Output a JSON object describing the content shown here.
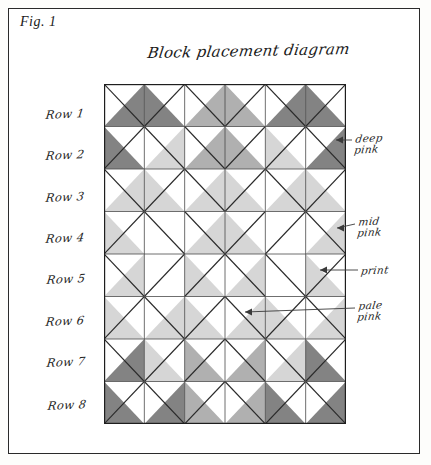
{
  "figure": {
    "label": "Fig. 1",
    "title": "Block placement diagram"
  },
  "rows": [
    {
      "label": "Row 1"
    },
    {
      "label": "Row 2"
    },
    {
      "label": "Row 3"
    },
    {
      "label": "Row 4"
    },
    {
      "label": "Row 5"
    },
    {
      "label": "Row 6"
    },
    {
      "label": "Row 7"
    },
    {
      "label": "Row 8"
    }
  ],
  "callouts": [
    {
      "id": "deep-pink",
      "label": "deep\npink"
    },
    {
      "id": "mid-pink",
      "label": "mid\npink"
    },
    {
      "id": "print",
      "label": "print"
    },
    {
      "id": "pale-pink",
      "label": "pale\npink"
    }
  ],
  "palette": {
    "deep_pink": "#838383",
    "mid_pink": "#b0b0b0",
    "pale_pink": "#d6d6d6",
    "print": "#ffffff",
    "ink": "#2a2a2a",
    "paper": "#ffffff"
  },
  "chart_data": {
    "type": "diagram",
    "title": "Block placement diagram",
    "grid": {
      "rows": 8,
      "cols": 6,
      "cell_px": 40.3
    },
    "fabrics": [
      "print",
      "pale pink",
      "mid pink",
      "deep pink"
    ],
    "note": "Each grid cell is a half-square-triangle block split along one diagonal; the two triangles are listed as [upper-left triangle, lower-right triangle] for diagonal '\\' cells and [upper-right, lower-left] for diagonal '/' cells.",
    "cells": [
      [
        {
          "d": "\\",
          "a": "print",
          "b": "deep"
        },
        {
          "d": "/",
          "a": "print",
          "b": "deep"
        },
        {
          "d": "\\",
          "a": "print",
          "b": "mid"
        },
        {
          "d": "/",
          "a": "print",
          "b": "mid"
        },
        {
          "d": "\\",
          "a": "print",
          "b": "deep"
        },
        {
          "d": "/",
          "a": "print",
          "b": "deep"
        }
      ],
      [
        {
          "d": "/",
          "a": "print",
          "b": "deep"
        },
        {
          "d": "\\",
          "a": "print",
          "b": "pale"
        },
        {
          "d": "\\",
          "a": "print",
          "b": "mid"
        },
        {
          "d": "/",
          "a": "print",
          "b": "mid"
        },
        {
          "d": "/",
          "a": "print",
          "b": "pale"
        },
        {
          "d": "\\",
          "a": "print",
          "b": "deep"
        }
      ],
      [
        {
          "d": "\\",
          "a": "print",
          "b": "pale"
        },
        {
          "d": "/",
          "a": "print",
          "b": "pale"
        },
        {
          "d": "\\",
          "a": "print",
          "b": "pale"
        },
        {
          "d": "/",
          "a": "print",
          "b": "pale"
        },
        {
          "d": "\\",
          "a": "print",
          "b": "pale"
        },
        {
          "d": "/",
          "a": "print",
          "b": "pale"
        }
      ],
      [
        {
          "d": "/",
          "a": "print",
          "b": "pale"
        },
        {
          "d": "\\",
          "a": "print",
          "b": "print"
        },
        {
          "d": "\\",
          "a": "print",
          "b": "pale"
        },
        {
          "d": "/",
          "a": "print",
          "b": "pale"
        },
        {
          "d": "/",
          "a": "print",
          "b": "print"
        },
        {
          "d": "\\",
          "a": "print",
          "b": "pale"
        }
      ],
      [
        {
          "d": "\\",
          "a": "print",
          "b": "pale"
        },
        {
          "d": "/",
          "a": "print",
          "b": "print"
        },
        {
          "d": "/",
          "a": "print",
          "b": "pale"
        },
        {
          "d": "\\",
          "a": "print",
          "b": "pale"
        },
        {
          "d": "\\",
          "a": "print",
          "b": "print"
        },
        {
          "d": "/",
          "a": "print",
          "b": "pale"
        }
      ],
      [
        {
          "d": "/",
          "a": "print",
          "b": "pale"
        },
        {
          "d": "\\",
          "a": "print",
          "b": "pale"
        },
        {
          "d": "/",
          "a": "print",
          "b": "pale"
        },
        {
          "d": "\\",
          "a": "print",
          "b": "pale"
        },
        {
          "d": "/",
          "a": "print",
          "b": "pale"
        },
        {
          "d": "\\",
          "a": "print",
          "b": "pale"
        }
      ],
      [
        {
          "d": "\\",
          "a": "print",
          "b": "deep"
        },
        {
          "d": "/",
          "a": "print",
          "b": "pale"
        },
        {
          "d": "/",
          "a": "print",
          "b": "mid"
        },
        {
          "d": "\\",
          "a": "print",
          "b": "mid"
        },
        {
          "d": "\\",
          "a": "print",
          "b": "pale"
        },
        {
          "d": "/",
          "a": "print",
          "b": "deep"
        }
      ],
      [
        {
          "d": "/",
          "a": "print",
          "b": "deep"
        },
        {
          "d": "\\",
          "a": "print",
          "b": "deep"
        },
        {
          "d": "/",
          "a": "print",
          "b": "mid"
        },
        {
          "d": "\\",
          "a": "print",
          "b": "mid"
        },
        {
          "d": "/",
          "a": "print",
          "b": "deep"
        },
        {
          "d": "\\",
          "a": "print",
          "b": "deep"
        }
      ]
    ]
  }
}
